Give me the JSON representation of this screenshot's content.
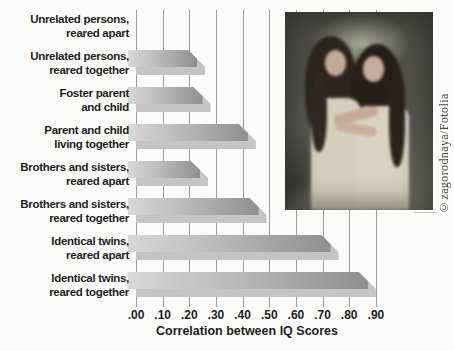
{
  "chart_data": {
    "type": "bar",
    "orientation": "horizontal",
    "xlabel": "Correlation between IQ Scores",
    "categories": [
      {
        "line1": "Unrelated persons,",
        "line2": "reared apart"
      },
      {
        "line1": "Unrelated persons,",
        "line2": "reared together"
      },
      {
        "line1": "Foster parent",
        "line2": "and child"
      },
      {
        "line1": "Parent and child",
        "line2": "living together"
      },
      {
        "line1": "Brothers and sisters,",
        "line2": "reared apart"
      },
      {
        "line1": "Brothers and sisters,",
        "line2": "reared together"
      },
      {
        "line1": "Identical twins,",
        "line2": "reared apart"
      },
      {
        "line1": "Identical twins,",
        "line2": "reared together"
      }
    ],
    "values": [
      0.0,
      0.23,
      0.25,
      0.42,
      0.24,
      0.46,
      0.73,
      0.87
    ],
    "xlim": [
      0.0,
      0.9
    ],
    "xticks": [
      ".00",
      ".10",
      ".20",
      ".30",
      ".40",
      ".50",
      ".60",
      ".70",
      ".80",
      ".90"
    ],
    "grid": "vertical-gridlines",
    "legend": "none",
    "colors": {
      "bar_gradient_start": "#d8d8d8",
      "bar_gradient_end": "#8f8f91",
      "bar_shadow": "#c4c4c6",
      "gridline": "#9b9b9b",
      "text": "#1d1d1d",
      "background": "#fcfcfa"
    }
  },
  "photo": {
    "description": "Photograph of identical twin girls with long dark hair embracing",
    "credit": "©zagorodnaya/Fotolia"
  }
}
